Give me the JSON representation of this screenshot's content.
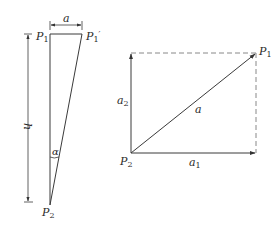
{
  "figure_left": {
    "point_top_left": {
      "name": "P",
      "sub": "1",
      "prime": ""
    },
    "point_top_right": {
      "name": "P",
      "sub": "1",
      "prime": "′"
    },
    "point_bottom": {
      "name": "P",
      "sub": "2"
    },
    "width_dimension": "a",
    "height_dimension": "h",
    "angle": "α"
  },
  "figure_right": {
    "point_end": {
      "name": "P",
      "sub": "1"
    },
    "point_origin": {
      "name": "P",
      "sub": "2"
    },
    "vertical_component": {
      "name": "a",
      "sub": "2"
    },
    "horizontal_component": {
      "name": "a",
      "sub": "1"
    },
    "resultant": "a"
  },
  "colors": {
    "stroke": "#3a3a3a",
    "dashed": "#7a7a7a",
    "text": "#2a2a2a"
  }
}
